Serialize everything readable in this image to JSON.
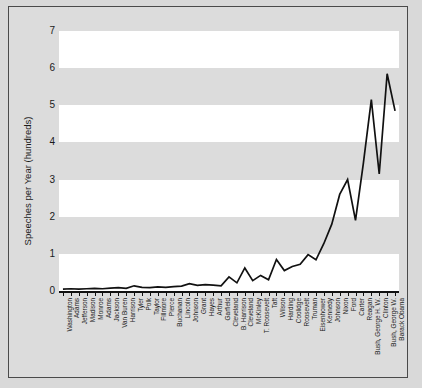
{
  "figure": {
    "background_color": "#dcdcdc",
    "plot_band_white": "#ffffff",
    "plot_band_gray": "#dcdcdc",
    "line_color": "#111111"
  },
  "chart_data": {
    "type": "line",
    "title": "",
    "xlabel": "",
    "ylabel": "Speeches per Year (hundreds)",
    "ylim": [
      0,
      7
    ],
    "yticks": [
      0,
      1,
      2,
      3,
      4,
      5,
      6,
      7
    ],
    "ytick_labels": [
      "0",
      "1",
      "2",
      "3",
      "4",
      "5",
      "6",
      "7"
    ],
    "grid": "horizontal-bands",
    "legend": "none",
    "categories": [
      "Washington",
      "Adams",
      "Jefferson",
      "Madison",
      "Monroe",
      "Adams",
      "Jackson",
      "Van Buren",
      "Harrison",
      "Tyler",
      "Polk",
      "Taylor",
      "Fillmore",
      "Pierce",
      "Buchanan",
      "Lincoln",
      "Johnson",
      "Grant",
      "Hayes",
      "Arthur",
      "Garfield",
      "Cleveland",
      "B. Harrison",
      "Cleveland",
      "McKinley",
      "T. Roosevelt",
      "Taft",
      "Wilson",
      "Harding",
      "Coolidge",
      "Roosevelt",
      "Truman",
      "Eisenhower",
      "Kennedy",
      "Johnson",
      "Nixon",
      "Ford",
      "Carter",
      "Reagan",
      "Bush, George H. W.",
      "Clinton",
      "Bush, George W.",
      "Barack Obama"
    ],
    "values": [
      0.05,
      0.06,
      0.05,
      0.06,
      0.07,
      0.06,
      0.08,
      0.09,
      0.07,
      0.14,
      0.1,
      0.09,
      0.11,
      0.1,
      0.12,
      0.13,
      0.2,
      0.15,
      0.17,
      0.16,
      0.14,
      0.38,
      0.22,
      0.62,
      0.28,
      0.42,
      0.3,
      0.85,
      0.55,
      0.66,
      0.72,
      0.98,
      0.84,
      1.28,
      1.8,
      2.6,
      3.0,
      1.9,
      3.45,
      5.15,
      3.15,
      5.85,
      4.85
    ]
  }
}
